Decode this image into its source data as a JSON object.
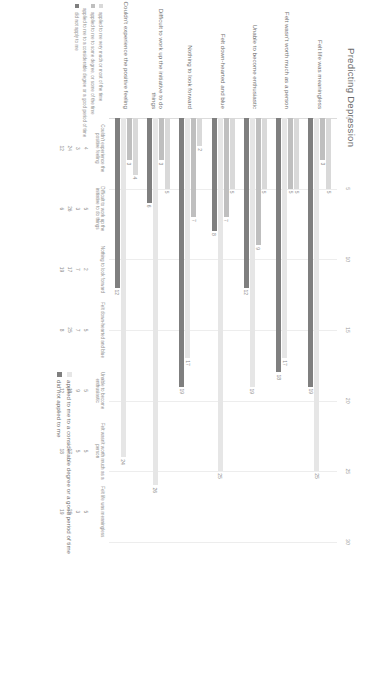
{
  "chart": {
    "title": "Predicting Depression"
  },
  "legend": {
    "left_items": [
      "applied to me very much or most of the time",
      "applied to me to a considerable degree or a good period of time",
      "applied to me to some degree, or some of the time",
      "did not apply to me"
    ],
    "right_items": [
      "applied to me to a considerable degree or a good period of time",
      "did not applied to me"
    ],
    "table_row_heads": [
      "applied to me very much or most of the time",
      "applied to me to some degree, or some of the time",
      "applied to me to a considerable degree or a good period of time",
      "did not apply to me"
    ]
  },
  "chart_data": {
    "type": "bar",
    "title": "Predicting Depression",
    "orientation": "horizontal",
    "xlabel": "",
    "ylabel": "",
    "xlim": [
      0,
      30
    ],
    "xticks": [
      0,
      5,
      10,
      15,
      20,
      25,
      30
    ],
    "grid": true,
    "legend_position": "bottom",
    "categories": [
      "Felt life was meaningless",
      "Felt wasn't worth much as a person",
      "Unable to become enthusiastic",
      "Felt down-hearted and blue",
      "Nothing to look forward",
      "Difficult to work up the initiative to do things",
      "Couldn't experience the positive feeling"
    ],
    "series": [
      {
        "name": "applied to me very much or most of the time",
        "color": "#d9d9d9",
        "values": [
          5,
          5,
          5,
          5,
          2,
          5,
          4
        ]
      },
      {
        "name": "applied to me to some degree, or some of the time",
        "color": "#bfbfbf",
        "values": [
          3,
          5,
          9,
          7,
          7,
          3,
          3
        ]
      },
      {
        "name": "applied to me to a considerable degree or a good period of time",
        "color": "#e6e6e6",
        "values": [
          25,
          17,
          19,
          25,
          17,
          26,
          24
        ]
      },
      {
        "name": "did not apply to me",
        "color": "#7f7f7f",
        "values": [
          19,
          18,
          12,
          8,
          19,
          6,
          12
        ]
      }
    ],
    "table": {
      "col_headers": [
        "Couldn't experience the positive feeling",
        "Difficult to work up the initiative to do things",
        "Nothing to look forward",
        "Felt down-hearted and blue",
        "Unable to become enthusiastic",
        "Felt wasn't worth much as a person",
        "Felt life was meaningless"
      ],
      "rows": [
        {
          "label": "applied to me very much or most of the time",
          "values": [
            4,
            5,
            2,
            5,
            5,
            5,
            5
          ]
        },
        {
          "label": "applied to me to some degree, or some of the time",
          "values": [
            3,
            3,
            7,
            7,
            9,
            5,
            3
          ]
        },
        {
          "label": "applied to me to a considerable degree or a good period of time",
          "values": [
            24,
            26,
            17,
            25,
            19,
            17,
            25
          ]
        },
        {
          "label": "did not apply to me",
          "values": [
            12,
            6,
            19,
            8,
            12,
            18,
            19
          ]
        }
      ]
    }
  }
}
